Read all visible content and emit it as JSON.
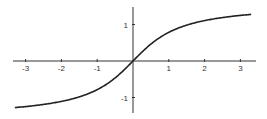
{
  "chart_data": {
    "type": "line",
    "title": "",
    "xlabel": "",
    "ylabel": "",
    "function": "arctan(x)",
    "xlim": [
      -3.3,
      3.3
    ],
    "ylim": [
      -1.4,
      1.5
    ],
    "grid": false,
    "legend": null,
    "x_ticks": [
      -3,
      -2,
      -1,
      1,
      2,
      3
    ],
    "x_tick_labels": [
      "-3",
      "-2",
      "-1",
      "1",
      "2",
      "3"
    ],
    "y_ticks": [
      1,
      -1
    ],
    "y_tick_labels": [
      "1",
      "-1"
    ],
    "series": [
      {
        "name": "arctan",
        "x": [
          -3.3,
          -3,
          -2.5,
          -2,
          -1.5,
          -1,
          -0.5,
          0,
          0.5,
          1,
          1.5,
          2,
          2.5,
          3,
          3.3
        ],
        "y": [
          -1.276,
          -1.249,
          -1.19,
          -1.107,
          -0.983,
          -0.785,
          -0.464,
          0,
          0.464,
          0.785,
          0.983,
          1.107,
          1.19,
          1.249,
          1.276
        ]
      }
    ],
    "colors": {
      "axis": "#333333",
      "curve": "#222222"
    }
  }
}
